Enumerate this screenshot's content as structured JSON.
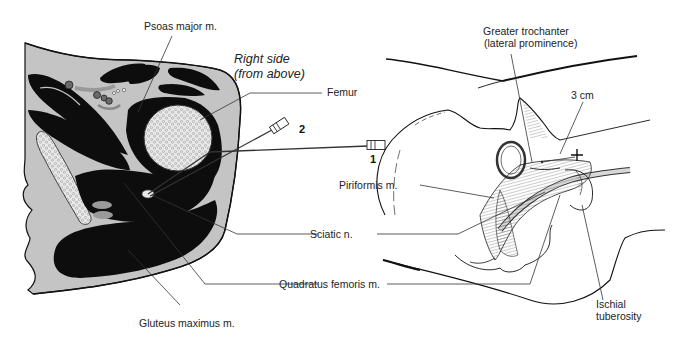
{
  "figure": {
    "left_panel": {
      "caption": [
        "Right side",
        "(from above)"
      ],
      "labels": {
        "psoas": "Psoas major m.",
        "femur": "Femur",
        "sciatic": "Sciatic n.",
        "quadratus": "Quadratus femoris m.",
        "gluteus": "Gluteus maximus m."
      },
      "needles": [
        {
          "id": "2",
          "label": "2"
        },
        {
          "id": "1",
          "label": "1"
        }
      ]
    },
    "right_panel": {
      "labels": {
        "trochanter": [
          "Greater trochanter",
          "(lateral prominence)"
        ],
        "distance": "3 cm",
        "piriformis": "Piriformis m.",
        "ischial": [
          "Ischial",
          "tuberosity"
        ]
      }
    },
    "colors": {
      "muscle": "#0d0d0d",
      "tissue": "#c4c4c4",
      "bone": "#e6e6e6",
      "line": "#1a1a1a"
    }
  }
}
